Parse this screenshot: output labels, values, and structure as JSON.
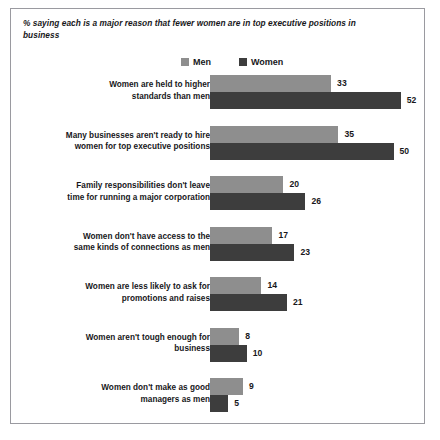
{
  "chart_data": {
    "type": "bar",
    "orientation": "horizontal",
    "title": "% saying each is a major reason that fewer women are in top executive positions in business",
    "xlabel": "",
    "ylabel": "",
    "grid": false,
    "legend_position": "top",
    "xlim": [
      0,
      60
    ],
    "categories": [
      "Women are held to higher standards than men",
      "Many businesses aren't ready to hire women for top executive positions",
      "Family responsibilities don't leave time for running a major corporation",
      "Women don't have access to the same kinds of connections as men",
      "Women are less likely to ask for promotions and raises",
      "Women aren't tough enough for business",
      "Women don't make as good managers as men"
    ],
    "category_lines": [
      [
        "Women are held to higher",
        "standards than men"
      ],
      [
        "Many businesses aren't ready to hire",
        "women for top executive positions"
      ],
      [
        "Family responsibilities don't leave",
        "time for running a major corporation"
      ],
      [
        "Women don't have access to the",
        "same kinds of connections as men"
      ],
      [
        "Women are less likely to ask for",
        "promotions and raises"
      ],
      [
        "Women aren't tough enough for",
        "business"
      ],
      [
        "Women don't make as good",
        "managers as men"
      ]
    ],
    "series": [
      {
        "name": "Men",
        "color": "#8e8e8e",
        "values": [
          33,
          35,
          20,
          17,
          14,
          8,
          9
        ]
      },
      {
        "name": "Women",
        "color": "#3d3d3d",
        "values": [
          52,
          50,
          26,
          23,
          21,
          10,
          5
        ]
      }
    ]
  }
}
